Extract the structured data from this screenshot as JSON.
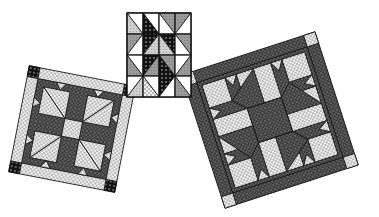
{
  "scene": {
    "description": "Three patchwork quilt block illustrations",
    "background": "#ffffff"
  },
  "blocks": [
    {
      "name": "pinwheel-star-block",
      "position": "top-center",
      "grid": "4x4 half-square triangles"
    },
    {
      "name": "left-shoofly-variant-block",
      "position": "left",
      "rotation": "tilted clockwise",
      "border": "light dotted with dark cornerstones"
    },
    {
      "name": "right-shoofly-variant-block",
      "position": "right",
      "rotation": "tilted counter-clockwise",
      "border": "dark with light cornerstones"
    }
  ],
  "colors": {
    "dark": "#2b2b2b",
    "mid": "#7a7a7a",
    "light": "#d8d8d8",
    "line": "#111111"
  }
}
